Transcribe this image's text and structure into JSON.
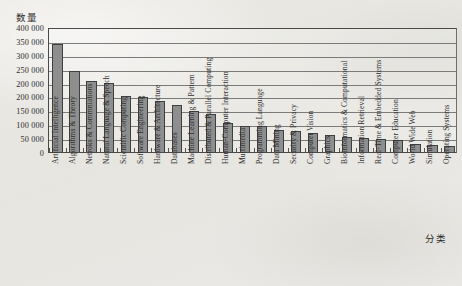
{
  "chart_data": {
    "type": "bar",
    "title": "",
    "ylabel": "数量",
    "xlabel": "分类",
    "ylim": [
      0,
      400000
    ],
    "grid": true,
    "legend": "none",
    "ytick_labels": [
      "400 000",
      "350 000",
      "300 000",
      "250 000",
      "200 000",
      "200 000",
      "150 000",
      "100 000",
      "50 000",
      "0"
    ],
    "ytick_values": [
      400000,
      350000,
      300000,
      250000,
      200000,
      200000,
      150000,
      100000,
      50000,
      0
    ],
    "categories": [
      "Artificial Intelligence",
      "Algorithms & Theory",
      "Netroks & Commniations",
      "Natural Language & Speech",
      "Scientific Computing",
      "Software Engineering",
      "Hardware & Architecture",
      "Databases",
      "Machine Learning & Pattern",
      "Distributed & Parallel Computing",
      "Human-Computer Interaction",
      "Multimedia",
      "Programming Language",
      "Data Mining",
      "Security & Privacy",
      "Computer Vision",
      "Graphics",
      "Bioinformatics & Computational",
      "Information Retrieval",
      "Real-Time & Embedded Systems",
      "Computer Education",
      "World Wide Web",
      "Simulation",
      "Operating Systems"
    ],
    "values": [
      345000,
      258000,
      228000,
      222000,
      178000,
      176000,
      164000,
      152000,
      130000,
      121000,
      92000,
      84000,
      82000,
      70000,
      66000,
      62000,
      56000,
      47000,
      45000,
      42000,
      38000,
      26000,
      22000,
      18000
    ],
    "colors": {
      "bar_fill": "#8e8e8e",
      "bar_stroke": "#3f3f3f",
      "gridline": "#7b7b7b",
      "axis": "#4a4a4a",
      "text": "#2c2c2c",
      "background": "#eceae6"
    }
  }
}
